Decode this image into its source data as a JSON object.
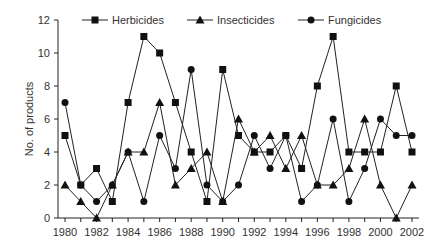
{
  "chart_data": {
    "type": "line",
    "title": "",
    "xlabel": "",
    "ylabel": "No. of products",
    "ylim": [
      0,
      12
    ],
    "xlim": [
      1980,
      2002
    ],
    "yticks": [
      0,
      2,
      4,
      6,
      8,
      10,
      12
    ],
    "xtick_labels": [
      "1980",
      "1982",
      "1984",
      "1986",
      "1988",
      "1990",
      "1992",
      "1994",
      "1996",
      "1998",
      "2000",
      "2002"
    ],
    "grid": false,
    "legend_position": "top",
    "x": [
      1980,
      1981,
      1982,
      1983,
      1984,
      1985,
      1986,
      1987,
      1988,
      1989,
      1990,
      1991,
      1992,
      1993,
      1994,
      1995,
      1996,
      1997,
      1998,
      1999,
      2000,
      2001,
      2002
    ],
    "series": [
      {
        "name": "Herbicides",
        "marker": "square",
        "values": [
          5,
          2,
          3,
          1,
          7,
          11,
          10,
          7,
          4,
          1,
          9,
          5,
          4,
          4,
          5,
          3,
          8,
          11,
          4,
          4,
          4,
          8,
          4
        ]
      },
      {
        "name": "Insecticides",
        "marker": "triangle",
        "values": [
          2,
          1,
          0,
          2,
          4,
          4,
          7,
          2,
          3,
          4,
          1,
          6,
          4,
          5,
          3,
          5,
          2,
          2,
          3,
          6,
          2,
          0,
          2
        ]
      },
      {
        "name": "Fungicides",
        "marker": "circle",
        "values": [
          7,
          2,
          1,
          2,
          4,
          1,
          5,
          3,
          9,
          2,
          1,
          2,
          5,
          3,
          5,
          1,
          2,
          6,
          1,
          3,
          6,
          5,
          5
        ]
      }
    ]
  }
}
